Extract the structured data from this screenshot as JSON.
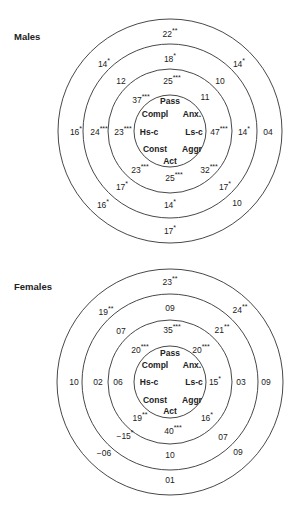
{
  "charts": [
    {
      "title": "Males",
      "rings": [
        "inner",
        "ring2",
        "ring3",
        "outer"
      ],
      "traits": [
        "Pass",
        "Compl",
        "Anx.",
        "Hs-c",
        "Ls-c",
        "Const",
        "Aggr",
        "Act"
      ],
      "values": [
        {
          "num": "22",
          "stars": "**"
        },
        {
          "num": "14",
          "stars": "*"
        },
        {
          "num": "18",
          "stars": "*"
        },
        {
          "num": "14",
          "stars": "*"
        },
        {
          "num": "12",
          "stars": ""
        },
        {
          "num": "25",
          "stars": "***"
        },
        {
          "num": "10",
          "stars": ""
        },
        {
          "num": "37",
          "stars": "***"
        },
        {
          "num": "11",
          "stars": ""
        },
        {
          "num": "16",
          "stars": "*"
        },
        {
          "num": "24",
          "stars": "***"
        },
        {
          "num": "23",
          "stars": "***"
        },
        {
          "num": "47",
          "stars": "***"
        },
        {
          "num": "14",
          "stars": "*"
        },
        {
          "num": "04",
          "stars": ""
        },
        {
          "num": "23",
          "stars": "***"
        },
        {
          "num": "32",
          "stars": "***"
        },
        {
          "num": "25",
          "stars": "***"
        },
        {
          "num": "17",
          "stars": "*"
        },
        {
          "num": "17",
          "stars": "*"
        },
        {
          "num": "16",
          "stars": "*"
        },
        {
          "num": "14",
          "stars": "*"
        },
        {
          "num": "10",
          "stars": ""
        },
        {
          "num": "17",
          "stars": "*"
        }
      ]
    },
    {
      "title": "Females",
      "rings": [
        "inner",
        "ring2",
        "ring3",
        "outer"
      ],
      "traits": [
        "Pass",
        "Compl",
        "Anx.",
        "Hs-c",
        "Ls-c",
        "Const",
        "Aggr",
        "Act"
      ],
      "values": [
        {
          "num": "23",
          "stars": "**"
        },
        {
          "num": "19",
          "stars": "**"
        },
        {
          "num": "09",
          "stars": ""
        },
        {
          "num": "24",
          "stars": "**"
        },
        {
          "num": "07",
          "stars": ""
        },
        {
          "num": "35",
          "stars": "***"
        },
        {
          "num": "21",
          "stars": "**"
        },
        {
          "num": "20",
          "stars": "***"
        },
        {
          "num": "20",
          "stars": "***"
        },
        {
          "num": "10",
          "stars": ""
        },
        {
          "num": "02",
          "stars": ""
        },
        {
          "num": "06",
          "stars": ""
        },
        {
          "num": "15",
          "stars": "*"
        },
        {
          "num": "03",
          "stars": ""
        },
        {
          "num": "09",
          "stars": ""
        },
        {
          "num": "19",
          "stars": "**"
        },
        {
          "num": "16",
          "stars": "*"
        },
        {
          "num": "40",
          "stars": "***"
        },
        {
          "num": "−15",
          "stars": "*"
        },
        {
          "num": "07",
          "stars": ""
        },
        {
          "num": "−06",
          "stars": ""
        },
        {
          "num": "10",
          "stars": ""
        },
        {
          "num": "09",
          "stars": ""
        },
        {
          "num": "01",
          "stars": ""
        }
      ]
    }
  ]
}
